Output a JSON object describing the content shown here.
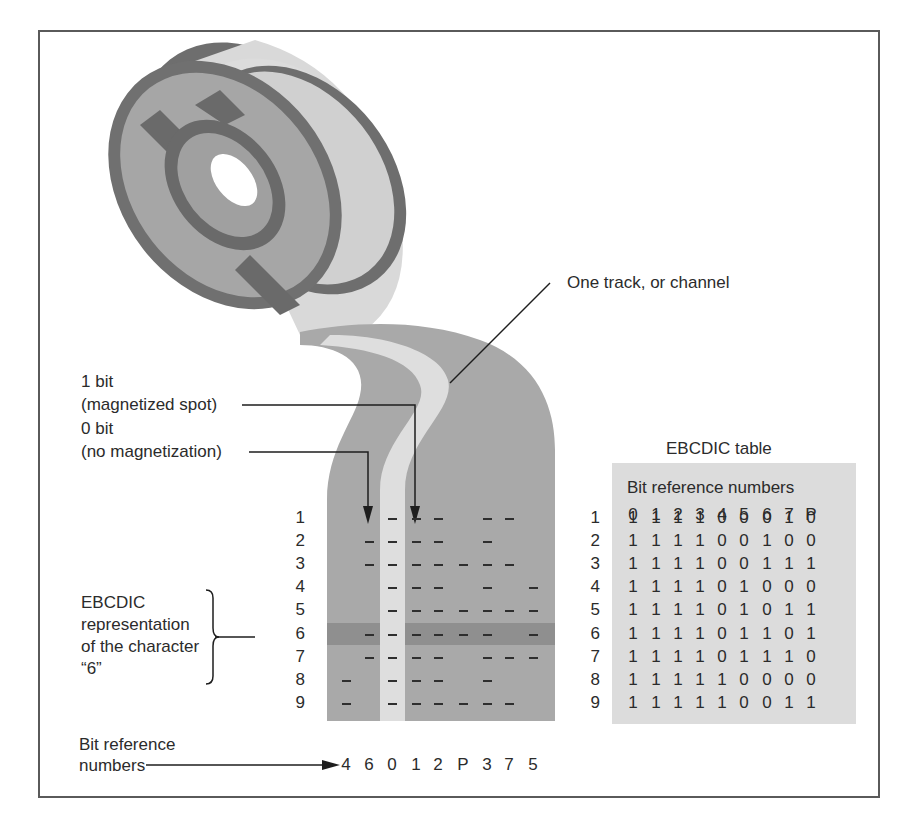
{
  "figure": {
    "labels": {
      "track": "One track, or channel",
      "one_bit_line1": "1 bit",
      "one_bit_line2": "(magnetized spot)",
      "zero_bit_line1": "0 bit",
      "zero_bit_line2": "(no magnetization)",
      "ebcdic_rep_line1": "EBCDIC",
      "ebcdic_rep_line2": "representation",
      "ebcdic_rep_line3": "of the character",
      "ebcdic_rep_line4": "“6”",
      "bitref_line1": "Bit reference",
      "bitref_line2": "numbers"
    },
    "tape": {
      "row_numbers": [
        "1",
        "2",
        "3",
        "4",
        "5",
        "6",
        "7",
        "8",
        "9"
      ],
      "column_order": [
        "4",
        "6",
        "0",
        "1",
        "2",
        "P",
        "3",
        "7",
        "5"
      ],
      "highlighted_row": "6"
    },
    "table": {
      "title": "EBCDIC table",
      "subtitle": "Bit reference numbers",
      "columns": [
        "0",
        "1",
        "2",
        "3",
        "4",
        "5",
        "6",
        "7",
        "P"
      ],
      "rows": [
        {
          "label": "1",
          "bits": [
            "1",
            "1",
            "1",
            "1",
            "0",
            "0",
            "0",
            "1",
            "0"
          ]
        },
        {
          "label": "2",
          "bits": [
            "1",
            "1",
            "1",
            "1",
            "0",
            "0",
            "1",
            "0",
            "0"
          ]
        },
        {
          "label": "3",
          "bits": [
            "1",
            "1",
            "1",
            "1",
            "0",
            "0",
            "1",
            "1",
            "1"
          ]
        },
        {
          "label": "4",
          "bits": [
            "1",
            "1",
            "1",
            "1",
            "0",
            "1",
            "0",
            "0",
            "0"
          ]
        },
        {
          "label": "5",
          "bits": [
            "1",
            "1",
            "1",
            "1",
            "0",
            "1",
            "0",
            "1",
            "1"
          ]
        },
        {
          "label": "6",
          "bits": [
            "1",
            "1",
            "1",
            "1",
            "0",
            "1",
            "1",
            "0",
            "1"
          ]
        },
        {
          "label": "7",
          "bits": [
            "1",
            "1",
            "1",
            "1",
            "0",
            "1",
            "1",
            "1",
            "0"
          ]
        },
        {
          "label": "8",
          "bits": [
            "1",
            "1",
            "1",
            "1",
            "1",
            "0",
            "0",
            "0",
            "0"
          ]
        },
        {
          "label": "9",
          "bits": [
            "1",
            "1",
            "1",
            "1",
            "1",
            "0",
            "0",
            "1",
            "1"
          ]
        }
      ]
    },
    "colors": {
      "tape": "#a9a9a9",
      "tape_track": "#dedede",
      "highlight_band": "#8f8f8f",
      "reel_dark": "#6e6e6e",
      "reel_mid": "#a6a6a6",
      "reel_light": "#d9d9d9",
      "table_bg": "#dcdcdc"
    }
  }
}
